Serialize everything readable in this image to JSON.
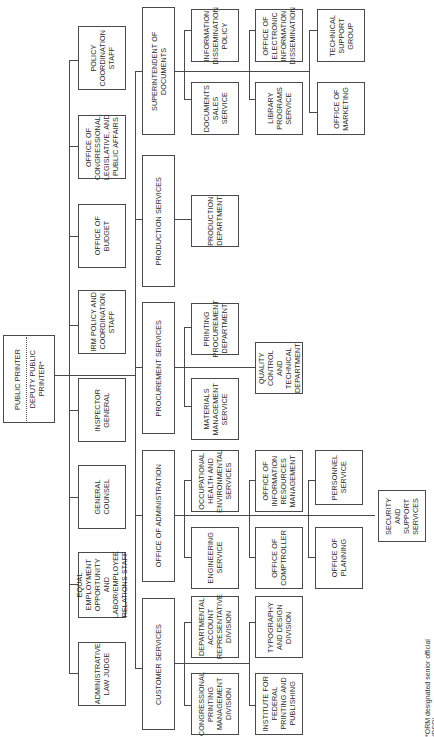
{
  "chart": {
    "orientation": "rotated-90-ccw",
    "top": {
      "public_printer": "PUBLIC PRINTER",
      "deputy_public_printer": "DEPUTY PUBLIC\nPRINTER*"
    },
    "staff_offices": [
      "ADMINISTRATIVE\nLAW JUDGE",
      "EQUAL\nEMPLOYMENT\nOPPORTUNITY AND\nLABOR/EMPLOYEE\nRELATIONS STAFF",
      "GENERAL\nCOUNSEL",
      "INSPECTOR\nGENERAL",
      "IRM POLICY AND\nCOORDINATION\nSTAFF",
      "OFFICE OF\nBUDGET",
      "OFFICE OF\nCONGRESSIONAL,\nLEGISLATIVE, AND\nPUBLIC AFFAIRS",
      "POLICY\nCOORDINATION\nSTAFF"
    ],
    "divisions": {
      "customer_services": {
        "label": "CUSTOMER SERVICES",
        "children": [
          "CONGRESSIONAL\nPRINTING\nMANAGEMENT\nDIVISION",
          "DEPARTMENTAL\nACCOUNT\nREPRESENTATIVE\nDIVISION",
          "INSTITUTE FOR\nFEDERAL\nPRINTING AND\nPUBLISHING",
          "TYPOGRAPHY\nAND DESIGN\nDIVISION"
        ]
      },
      "office_of_administration": {
        "label": "OFFICE OF ADMINISTRATION",
        "children": [
          "ENGINEERING\nSERVICE",
          "OCCUPATIONAL\nHEALTH AND\nENVIRONMENTAL\nSERVICES",
          "OFFICE OF\nCOMPTROLLER",
          "OFFICE OF\nINFORMATION\nRESOURCES\nMANAGEMENT",
          "OFFICE OF\nPLANNING",
          "PERSONNEL\nSERVICE",
          "SECURITY\nAND SUPPORT\nSERVICES"
        ]
      },
      "procurement_services": {
        "label": "PROCUREMENT SERVICES",
        "children": [
          "MATERIALS\nMANAGEMENT\nSERVICE",
          "PRINTING\nPROCUREMENT\nDEPARTMENT",
          "QUALITY\nCONTROL AND\nTECHNICAL\nDEPARTMENT"
        ]
      },
      "production_services": {
        "label": "PRODUCTION SERVICES",
        "children": [
          "PRODUCTION\nDEPARTMENT"
        ]
      },
      "superintendent_of_documents": {
        "label": "SUPERINTENDENT OF DOCUMENTS",
        "children": [
          "DOCUMENTS\nSALES\nSERVICE",
          "INFORMATION\nDISSEMINATION\nPOLICY",
          "LIBRARY\nPROGRAMS\nSERVICE",
          "OFFICE OF\nELECTRONIC\nINFORMATION\nDISSEMINATION",
          "OFFICE OF\nMARKETING",
          "TECHNICAL\nSUPPORT\nGROUP"
        ]
      }
    },
    "footnote": "*ORM designated senior official (DSO)."
  }
}
